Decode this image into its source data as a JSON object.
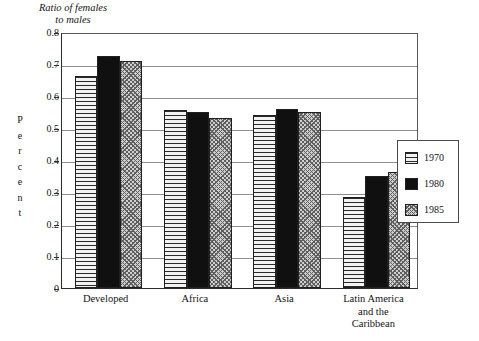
{
  "chart_data": {
    "type": "bar",
    "title": "Ratio of females to males",
    "title_line1": "Ratio of females",
    "title_line2": "to males",
    "xlabel": "",
    "ylabel": "Percent",
    "ylabel_chars": [
      "P",
      "e",
      "r",
      "c",
      "e",
      "n",
      "t"
    ],
    "ylim": [
      0,
      0.8
    ],
    "ytick_labels": [
      "0.8",
      "0.7",
      "0.6",
      "0.5",
      "0.4",
      "0.3",
      "0.2",
      "0.1",
      "0"
    ],
    "ytick_values": [
      0.8,
      0.7,
      0.6,
      0.5,
      0.4,
      0.3,
      0.2,
      0.1,
      0
    ],
    "grid": true,
    "grid_axis": "y",
    "legend_position": "right-outside",
    "categories": [
      "Developed",
      "Africa",
      "Asia",
      "Latin America and the Caribbean"
    ],
    "category_lines": [
      [
        "Developed"
      ],
      [
        "Africa"
      ],
      [
        "Asia"
      ],
      [
        "Latin America",
        "and the",
        "Caribbean"
      ]
    ],
    "series": [
      {
        "name": "1970",
        "pattern": "horizontal-lines",
        "color": "#e9e9e9",
        "values": [
          0.663,
          0.557,
          0.54,
          0.285
        ]
      },
      {
        "name": "1980",
        "pattern": "solid-black",
        "color": "#101010",
        "values": [
          0.725,
          0.55,
          0.56,
          0.35
        ]
      },
      {
        "name": "1985",
        "pattern": "crosshatch",
        "color": "#cfcfcf",
        "values": [
          0.71,
          0.53,
          0.55,
          0.363
        ]
      }
    ]
  },
  "legend": {
    "items": [
      {
        "label": "1970"
      },
      {
        "label": "1980"
      },
      {
        "label": "1985"
      }
    ]
  }
}
